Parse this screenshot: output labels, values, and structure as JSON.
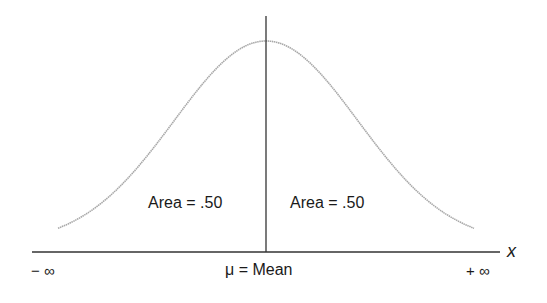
{
  "chart_data": {
    "type": "line",
    "title": "",
    "xlabel": "x",
    "ylabel": "",
    "x_ticks": [
      "− ∞",
      "μ = Mean",
      "+ ∞"
    ],
    "annotations": [
      {
        "text": "Area = .50",
        "position": "left of mean"
      },
      {
        "text": "Area = .50",
        "position": "right of mean"
      }
    ],
    "series": [
      {
        "name": "normal curve",
        "shape": "gaussian",
        "mean": 0,
        "left_area": 0.5,
        "right_area": 0.5
      }
    ],
    "grid": false,
    "legend": null
  },
  "labels": {
    "area_left": "Area = .50",
    "area_right": "Area = .50",
    "mean": "μ = Mean",
    "neg_inf": "− ∞",
    "pos_inf": "+ ∞",
    "x_axis": "x"
  },
  "colors": {
    "curve": "#a8a8a8",
    "axis": "#333333",
    "text": "#1a1a1a"
  }
}
